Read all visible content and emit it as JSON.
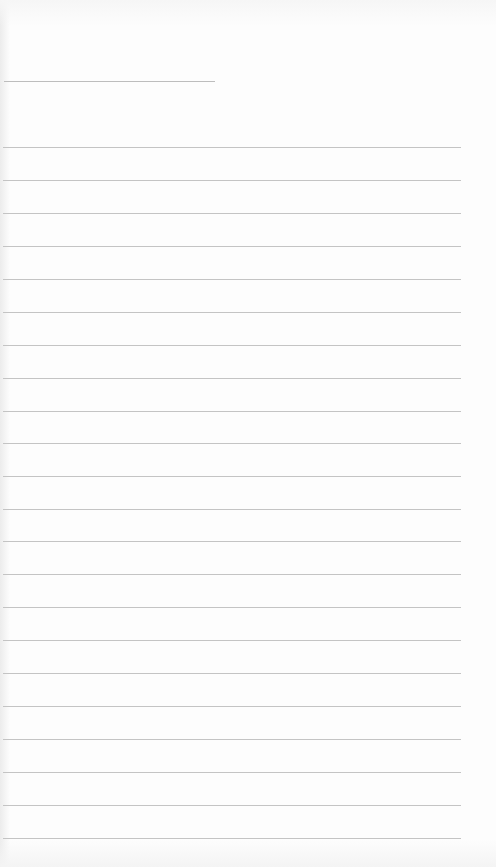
{
  "page": {
    "background": "#fdfdfd",
    "line_color": "#c4c4c4"
  },
  "header_line": {
    "x": 4,
    "y": 81,
    "width": 211
  },
  "ruled_lines": {
    "x": 3,
    "width": 458,
    "y_positions": [
      147,
      180,
      213,
      246,
      279,
      312,
      345,
      378,
      411,
      443,
      476,
      509,
      541,
      574,
      607,
      640,
      673,
      706,
      739,
      772,
      805,
      838
    ]
  }
}
